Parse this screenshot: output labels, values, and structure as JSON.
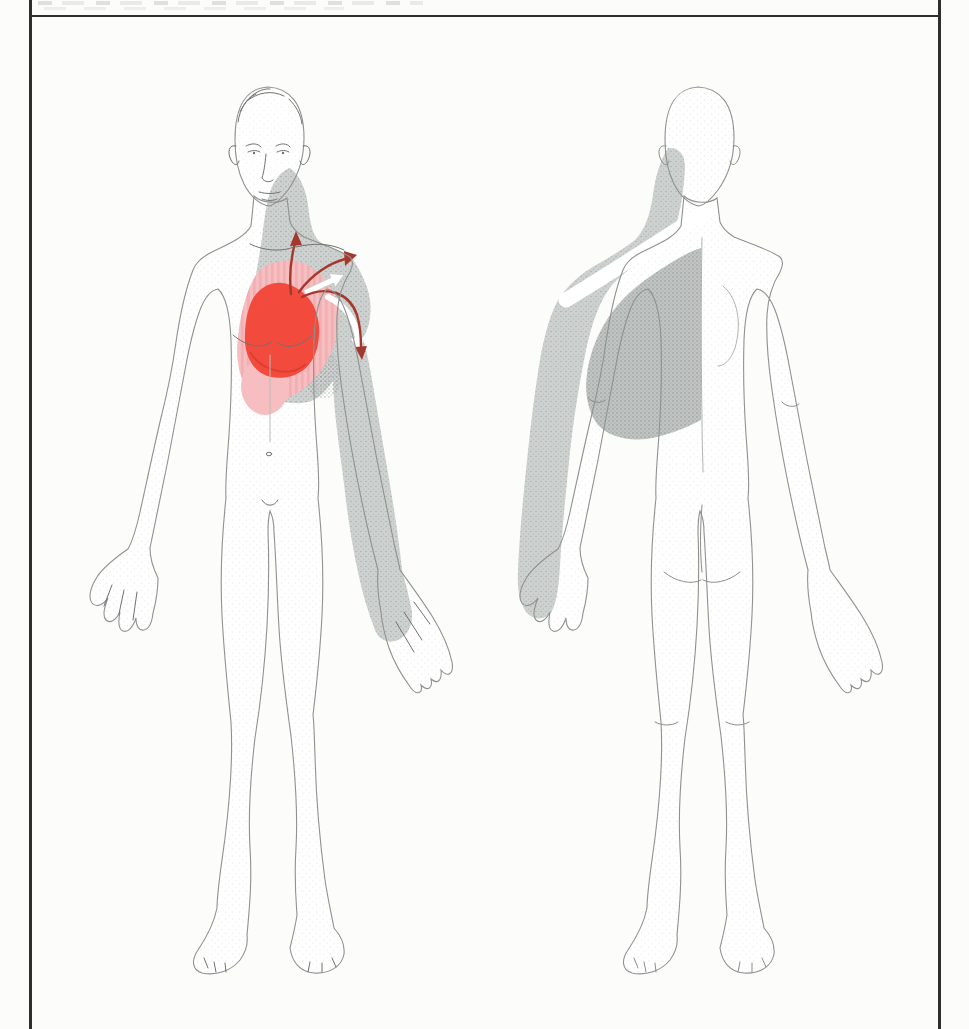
{
  "canvas": {
    "width": 969,
    "height": 1029,
    "background": "#fcfcfa"
  },
  "frame": {
    "color": "#2f2d2d",
    "top_rule_y": 15
  },
  "top_strip": {
    "description": "illegible cropped text marks"
  },
  "colors": {
    "heart_red": "#f24b3e",
    "heart_red_edge": "#d03428",
    "pain_pink": "#f6bec0",
    "pink_stripe": "#efa0a4",
    "referral_gray_light": "#cdd1d0",
    "referral_gray_dark": "#c0c5c4",
    "arrow_red": "#a5382d",
    "white": "#ffffff",
    "outline_gray": "#8f928f",
    "detail_gray": "#7d807d"
  },
  "illustration": {
    "subject": "pain referral pattern on human body, anterior and posterior views",
    "anterior_figure": {
      "primary_zone": {
        "name": "heart-region-solid-red",
        "color_key": "heart_red"
      },
      "spillover_zone": {
        "name": "chest-pink-zone",
        "color_key": "pain_pink"
      },
      "spillover_zone_lower": {
        "name": "epigastric-pink-zone",
        "color_key": "pain_pink"
      },
      "gray_zones": [
        {
          "name": "neck-shoulder-chest-gray-zone"
        },
        {
          "name": "inner-arm-hand-gray-zone"
        }
      ],
      "arrows": [
        {
          "name": "radiation-arrow-neck",
          "direction": "up",
          "color_key": "arrow_red"
        },
        {
          "name": "radiation-arrow-shoulder",
          "direction": "upper-right",
          "color_key": "arrow_red"
        },
        {
          "name": "radiation-arrow-arm",
          "direction": "down",
          "color_key": "arrow_red"
        },
        {
          "name": "white-arrow-shoulder",
          "direction": "upper-right",
          "color_key": "white"
        },
        {
          "name": "white-arrow-arm",
          "direction": "down",
          "color_key": "white"
        }
      ]
    },
    "posterior_figure": {
      "gray_zones": [
        {
          "name": "neck-shoulder-outer-arm-gray-zone"
        },
        {
          "name": "scapula-upper-back-gray-zone"
        }
      ],
      "unshaded_band": {
        "name": "diagonal-white-band-across-shoulder"
      }
    }
  }
}
